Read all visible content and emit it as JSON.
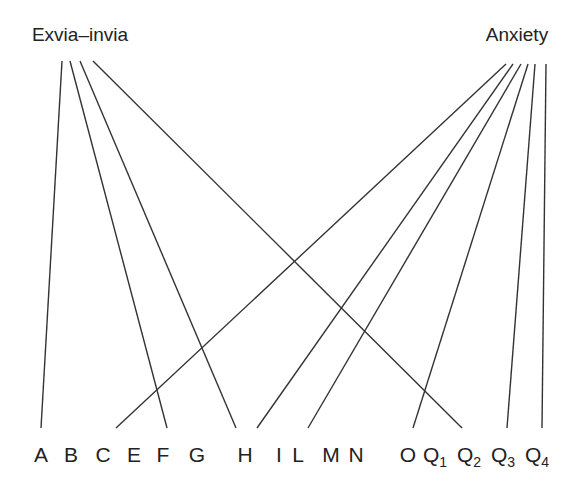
{
  "diagram": {
    "type": "bipartite-link-diagram",
    "line_color": "#333333",
    "top_nodes": [
      {
        "id": "exvia",
        "label": "Exvia–invia",
        "x": 80,
        "y": 41
      },
      {
        "id": "anxiety",
        "label": "Anxiety",
        "x": 517,
        "y": 41
      }
    ],
    "bottom_nodes": [
      {
        "id": "A",
        "label": "A",
        "sub": "",
        "x": 41
      },
      {
        "id": "B",
        "label": "B",
        "sub": "",
        "x": 71
      },
      {
        "id": "C",
        "label": "C",
        "sub": "",
        "x": 103
      },
      {
        "id": "E",
        "label": "E",
        "sub": "",
        "x": 134
      },
      {
        "id": "F",
        "label": "F",
        "sub": "",
        "x": 163
      },
      {
        "id": "G",
        "label": "G",
        "sub": "",
        "x": 197
      },
      {
        "id": "H",
        "label": "H",
        "sub": "",
        "x": 245
      },
      {
        "id": "I",
        "label": "I",
        "sub": "",
        "x": 279
      },
      {
        "id": "L",
        "label": "L",
        "sub": "",
        "x": 298
      },
      {
        "id": "M",
        "label": "M",
        "sub": "",
        "x": 331
      },
      {
        "id": "N",
        "label": "N",
        "sub": "",
        "x": 356
      },
      {
        "id": "O",
        "label": "O",
        "sub": "",
        "x": 408
      },
      {
        "id": "Q1",
        "label": "Q",
        "sub": "1",
        "x": 435
      },
      {
        "id": "Q2",
        "label": "Q",
        "sub": "2",
        "x": 469
      },
      {
        "id": "Q3",
        "label": "Q",
        "sub": "3",
        "x": 503
      },
      {
        "id": "Q4",
        "label": "Q",
        "sub": "4",
        "x": 537
      }
    ],
    "links": [
      {
        "from": "exvia",
        "to": "A",
        "x1": 62,
        "y1": 61,
        "x2": 41,
        "y2": 428
      },
      {
        "from": "exvia",
        "to": "F",
        "x1": 70,
        "y1": 61,
        "x2": 167,
        "y2": 428
      },
      {
        "from": "exvia",
        "to": "H",
        "x1": 80,
        "y1": 61,
        "x2": 236,
        "y2": 428
      },
      {
        "from": "exvia",
        "to": "Q2",
        "x1": 93,
        "y1": 61,
        "x2": 462,
        "y2": 428
      },
      {
        "from": "anxiety",
        "to": "C",
        "x1": 506,
        "y1": 64,
        "x2": 116,
        "y2": 428
      },
      {
        "from": "anxiety",
        "to": "H",
        "x1": 513,
        "y1": 64,
        "x2": 257,
        "y2": 428
      },
      {
        "from": "anxiety",
        "to": "L",
        "x1": 521,
        "y1": 64,
        "x2": 308,
        "y2": 428
      },
      {
        "from": "anxiety",
        "to": "Q1",
        "x1": 528,
        "y1": 64,
        "x2": 413,
        "y2": 428
      },
      {
        "from": "anxiety",
        "to": "Q3",
        "x1": 535,
        "y1": 64,
        "x2": 507,
        "y2": 428
      },
      {
        "from": "anxiety",
        "to": "Q4",
        "x1": 546,
        "y1": 64,
        "x2": 542,
        "y2": 428
      }
    ]
  }
}
